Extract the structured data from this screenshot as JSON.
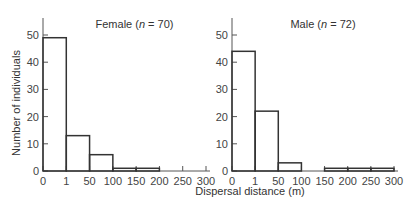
{
  "chart_data": [
    {
      "type": "bar",
      "title": "Female (n = 70)",
      "title_prefix": "Female (",
      "title_n": "n",
      "title_suffix": " = 70)",
      "xlabel": "Dispersal distance (m)",
      "ylabel": "Number of individuals",
      "categories": [
        "0-1",
        "1-50",
        "50-100",
        "100-150",
        "150-200",
        "200-250",
        "250-300"
      ],
      "values": [
        49,
        13,
        6,
        1,
        1,
        0,
        0
      ],
      "x_tick_labels": [
        "0",
        "1",
        "50",
        "100",
        "150",
        "200",
        "250",
        "300"
      ],
      "y_tick_labels": [
        "0",
        "10",
        "20",
        "30",
        "40",
        "50"
      ],
      "ylim": [
        0,
        55
      ]
    },
    {
      "type": "bar",
      "title": "Male (n = 72)",
      "title_prefix": "Male (",
      "title_n": "n",
      "title_suffix": " = 72)",
      "xlabel": "Dispersal distance (m)",
      "ylabel": "",
      "categories": [
        "0-1",
        "1-50",
        "50-100",
        "100-150",
        "150-200",
        "200-250",
        "250-300"
      ],
      "values": [
        44,
        22,
        3,
        0,
        1,
        1,
        1
      ],
      "x_tick_labels": [
        "0",
        "1",
        "50",
        "100",
        "150",
        "200",
        "250",
        "300"
      ],
      "y_tick_labels": [
        "0",
        "10",
        "20",
        "30",
        "40",
        "50"
      ],
      "ylim": [
        0,
        55
      ]
    }
  ],
  "labels": {
    "ylabel": "Number of individuals",
    "xlabel": "Dispersal distance (m)"
  },
  "colors": {
    "line": "#333333",
    "axis": "#555555"
  }
}
